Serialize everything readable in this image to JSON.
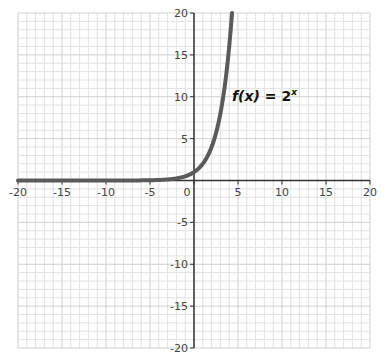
{
  "chart_data": {
    "type": "line",
    "title": "",
    "xlabel": "",
    "ylabel": "",
    "xlim": [
      -20,
      20
    ],
    "ylim": [
      -20,
      20
    ],
    "grid": true,
    "grid_step": 1,
    "x_ticks": [
      -20,
      -15,
      -10,
      -5,
      0,
      5,
      10,
      15,
      20
    ],
    "y_ticks": [
      -20,
      -15,
      -10,
      -5,
      5,
      10,
      15,
      20
    ],
    "x_tick_labels": [
      "-20",
      "-15",
      "-10",
      "-5",
      "0",
      "5",
      "10",
      "15",
      "20"
    ],
    "y_tick_labels": [
      "-20",
      "-15",
      "-10",
      "-5",
      "5",
      "10",
      "15",
      "20"
    ],
    "series": [
      {
        "name": "f(x) = 2^x",
        "function": "2^x",
        "color": "#5a5a5a",
        "x": [
          -20,
          -10,
          -5,
          -4,
          -3,
          -2,
          -1,
          0,
          1,
          2,
          3,
          4,
          4.32
        ],
        "y": [
          1e-06,
          0.001,
          0.03125,
          0.0625,
          0.125,
          0.25,
          0.5,
          1,
          2,
          4,
          8,
          16,
          20
        ]
      }
    ],
    "annotations": [
      {
        "text_f": "f",
        "text_x": "(x)",
        "text_eq": " = 2",
        "text_sup": "x",
        "x": 4.6,
        "y": 10
      }
    ]
  },
  "colors": {
    "grid_minor": "#e2e2e2",
    "grid_major": "#cfcfcf",
    "axis": "#333333",
    "curve": "#5a5a5a"
  }
}
